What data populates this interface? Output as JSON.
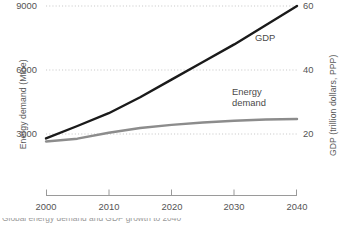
{
  "chart_data": {
    "type": "line",
    "title": "",
    "xlabel": "",
    "x": [
      2000,
      2005,
      2010,
      2015,
      2020,
      2025,
      2030,
      2035,
      2040
    ],
    "xlim": [
      2000,
      2040
    ],
    "xticks": [
      "2000",
      "2010",
      "2020",
      "2030",
      "2040"
    ],
    "grid": true,
    "legend_position": "inline-annotation",
    "axes": {
      "left": {
        "label": "Energy demand (Mtoe)",
        "unit": "Mtoe",
        "ticks": [
          "3000",
          "6000",
          "9000"
        ],
        "tick_values": [
          3000,
          6000,
          9000
        ],
        "lim": [
          0,
          9000
        ]
      },
      "right": {
        "label": "GDP (trillion dollars, PPP)",
        "unit": "trillion dollars, PPP",
        "ticks": [
          "20",
          "40",
          "60"
        ],
        "tick_values": [
          20,
          40,
          60
        ],
        "lim": [
          0,
          60
        ]
      }
    },
    "series": [
      {
        "name": "GDP",
        "label": "GDP",
        "axis": "right",
        "color": "#1a1a1a",
        "values": [
          18.6,
          22.5,
          26.5,
          31.5,
          37.0,
          42.5,
          48.0,
          54.0,
          60.0
        ]
      },
      {
        "name": "Energy demand",
        "label_line1": "Energy",
        "label_line2": "demand",
        "axis": "left",
        "color": "#8c8c8c",
        "values": [
          2650,
          2780,
          3060,
          3280,
          3430,
          3540,
          3620,
          3680,
          3700
        ]
      }
    ],
    "colors": {
      "gdp_line": "#1a1a1a",
      "energy_line": "#8c8c8c",
      "gridline": "#c9c9c9",
      "axis": "#8a8a8a",
      "text": "#4d4d4d"
    }
  },
  "caption": {
    "clipped_text": "Global energy demand and GDP growth to 2040"
  }
}
